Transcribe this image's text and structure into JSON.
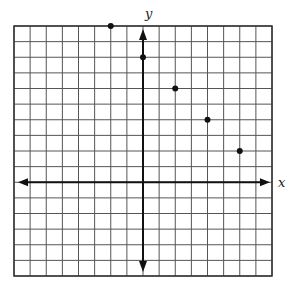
{
  "chart_data": {
    "type": "scatter",
    "title": "",
    "xlabel": "x",
    "ylabel": "y",
    "xlim": [
      -8,
      8
    ],
    "ylim": [
      -6,
      10
    ],
    "grid": true,
    "grid_step": 1,
    "tick_labels": false,
    "legend": null,
    "points": [
      {
        "x": -2,
        "y": 10
      },
      {
        "x": 0,
        "y": 8
      },
      {
        "x": 2,
        "y": 6
      },
      {
        "x": 4,
        "y": 4
      },
      {
        "x": 6,
        "y": 2
      }
    ]
  },
  "colors": {
    "grid": "#555555",
    "axis": "#111111",
    "point": "#111111",
    "background": "#ffffff"
  }
}
